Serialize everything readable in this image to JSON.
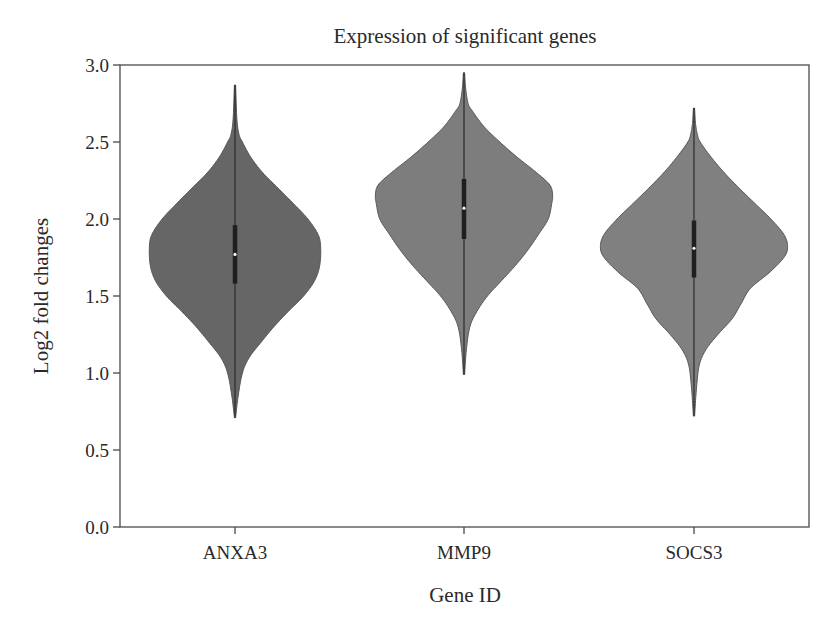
{
  "chart_data": {
    "type": "violin",
    "title": "Expression of significant genes",
    "xlabel": "Gene ID",
    "ylabel": "Log2 fold changes",
    "ylim": [
      0.0,
      3.0
    ],
    "yticks": [
      "0.0",
      "0.5",
      "1.0",
      "1.5",
      "2.0",
      "2.5",
      "3.0"
    ],
    "categories": [
      "ANXA3",
      "MMP9",
      "SOCS3"
    ],
    "grid": false,
    "legend": null,
    "series": [
      {
        "name": "ANXA3",
        "color": "#666666",
        "min": 0.71,
        "max": 2.87,
        "q1": 1.58,
        "median": 1.77,
        "q3": 1.96,
        "mode": 1.82,
        "max_half_width": 85,
        "profile": [
          [
            0.71,
            0.0
          ],
          [
            0.85,
            0.03
          ],
          [
            1.0,
            0.08
          ],
          [
            1.1,
            0.16
          ],
          [
            1.2,
            0.3
          ],
          [
            1.3,
            0.45
          ],
          [
            1.4,
            0.62
          ],
          [
            1.5,
            0.8
          ],
          [
            1.6,
            0.93
          ],
          [
            1.7,
            0.99
          ],
          [
            1.82,
            1.0
          ],
          [
            1.9,
            0.97
          ],
          [
            2.0,
            0.85
          ],
          [
            2.1,
            0.68
          ],
          [
            2.2,
            0.5
          ],
          [
            2.3,
            0.32
          ],
          [
            2.4,
            0.18
          ],
          [
            2.5,
            0.08
          ],
          [
            2.55,
            0.04
          ],
          [
            2.65,
            0.015
          ],
          [
            2.87,
            0.0
          ]
        ]
      },
      {
        "name": "MMP9",
        "color": "#7d7d7d",
        "min": 0.99,
        "max": 2.95,
        "q1": 1.87,
        "median": 2.07,
        "q3": 2.26,
        "mode": 2.15,
        "max_half_width": 88,
        "profile": [
          [
            0.99,
            0.0
          ],
          [
            1.15,
            0.02
          ],
          [
            1.3,
            0.06
          ],
          [
            1.4,
            0.14
          ],
          [
            1.5,
            0.26
          ],
          [
            1.6,
            0.42
          ],
          [
            1.7,
            0.58
          ],
          [
            1.8,
            0.72
          ],
          [
            1.9,
            0.84
          ],
          [
            2.0,
            0.95
          ],
          [
            2.1,
            0.99
          ],
          [
            2.15,
            1.0
          ],
          [
            2.22,
            0.97
          ],
          [
            2.3,
            0.82
          ],
          [
            2.4,
            0.6
          ],
          [
            2.5,
            0.4
          ],
          [
            2.6,
            0.22
          ],
          [
            2.7,
            0.09
          ],
          [
            2.75,
            0.04
          ],
          [
            2.85,
            0.012
          ],
          [
            2.95,
            0.0
          ]
        ]
      },
      {
        "name": "SOCS3",
        "color": "#808080",
        "min": 0.72,
        "max": 2.72,
        "q1": 1.62,
        "median": 1.81,
        "q3": 1.99,
        "mode": 1.82,
        "max_half_width": 93,
        "profile": [
          [
            0.72,
            0.0
          ],
          [
            0.9,
            0.02
          ],
          [
            1.05,
            0.05
          ],
          [
            1.15,
            0.12
          ],
          [
            1.25,
            0.25
          ],
          [
            1.35,
            0.4
          ],
          [
            1.45,
            0.5
          ],
          [
            1.55,
            0.6
          ],
          [
            1.65,
            0.8
          ],
          [
            1.75,
            0.96
          ],
          [
            1.82,
            1.0
          ],
          [
            1.9,
            0.96
          ],
          [
            2.0,
            0.82
          ],
          [
            2.1,
            0.65
          ],
          [
            2.2,
            0.48
          ],
          [
            2.3,
            0.32
          ],
          [
            2.4,
            0.18
          ],
          [
            2.5,
            0.06
          ],
          [
            2.55,
            0.03
          ],
          [
            2.62,
            0.01
          ],
          [
            2.72,
            0.0
          ]
        ]
      }
    ]
  }
}
